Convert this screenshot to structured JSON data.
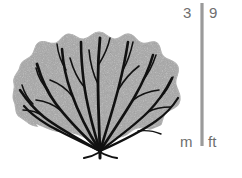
{
  "figure": {
    "background_color": "#ffffff"
  },
  "organism": {
    "body_color": "#a8a8a8",
    "body_edge_color": "#b4b4b4",
    "branch_color": "#111111",
    "description": "fan-shaped colony with branching skeleton radiating from a basal holdfast"
  },
  "scale_bar": {
    "bar_color": "#9a9a9a",
    "top_metric": "3",
    "top_imperial": "9",
    "bottom_metric": "m",
    "bottom_imperial": "ft",
    "metric_unit": "m",
    "imperial_unit": "ft",
    "metric_max": "3",
    "imperial_max": "9"
  }
}
